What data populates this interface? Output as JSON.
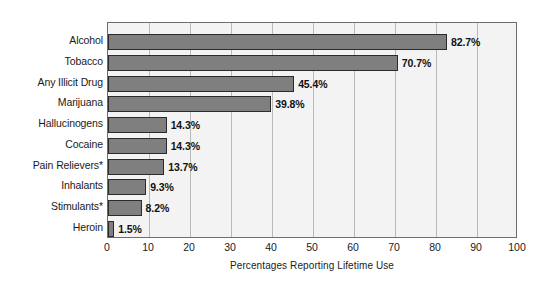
{
  "chart_data": {
    "type": "bar",
    "orientation": "horizontal",
    "title": "",
    "xlabel": "Percentages Reporting Lifetime Use",
    "ylabel": "",
    "xlim": [
      0,
      100
    ],
    "xticks": [
      "0",
      "10",
      "20",
      "30",
      "40",
      "50",
      "60",
      "70",
      "80",
      "90",
      "100"
    ],
    "xtick_values": [
      0,
      10,
      20,
      30,
      40,
      50,
      60,
      70,
      80,
      90,
      100
    ],
    "grid": true,
    "grid_axis": "x",
    "legend": "none",
    "categories": [
      "Alcohol",
      "Tobacco",
      "Any Illicit Drug",
      "Marijuana",
      "Hallucinogens",
      "Cocaine",
      "Pain Relievers*",
      "Inhalants",
      "Stimulants*",
      "Heroin"
    ],
    "values": [
      82.7,
      70.7,
      45.4,
      39.8,
      14.3,
      14.3,
      13.7,
      9.3,
      8.2,
      1.5
    ],
    "value_labels": [
      "82.7%",
      "70.7%",
      "45.4%",
      "39.8%",
      "14.3%",
      "14.3%",
      "13.7%",
      "9.3%",
      "8.2%",
      "1.5%"
    ],
    "colors": {
      "bar_fill": "#807f7f",
      "bar_edge": "#2b2b2b",
      "plot_background": "#f3f3f3",
      "gridline": "#b9b9b9",
      "frame": "#6e6e6e",
      "text": "#1a1a1a"
    }
  }
}
